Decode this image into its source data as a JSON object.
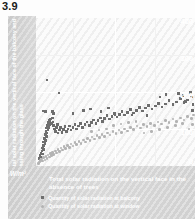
{
  "figure": {
    "number": "3.9"
  },
  "chart_data": {
    "type": "scatter",
    "title": "",
    "xlabel": "Total solar radiation on the vertical face in the absence of trees",
    "ylabel": "Total solar radiation on the vertical face of the balcony and passing through the glass",
    "unit": "W/m²",
    "yticks": [
      "400",
      "300",
      "200",
      "100",
      "0"
    ],
    "ylim": [
      0,
      430
    ],
    "xlim": [
      0,
      430
    ],
    "grid": true,
    "legend_position": "bottom-left",
    "series": [
      {
        "name": "Quantity of solar radiation at balcony",
        "marker": "square",
        "color": "#6e6e6e",
        "points": [
          [
            8,
            22
          ],
          [
            11,
            30
          ],
          [
            13,
            38
          ],
          [
            14,
            26
          ],
          [
            16,
            44
          ],
          [
            17,
            52
          ],
          [
            18,
            35
          ],
          [
            19,
            60
          ],
          [
            20,
            48
          ],
          [
            21,
            70
          ],
          [
            22,
            58
          ],
          [
            23,
            80
          ],
          [
            24,
            66
          ],
          [
            25,
            92
          ],
          [
            26,
            74
          ],
          [
            27,
            100
          ],
          [
            28,
            86
          ],
          [
            29,
            110
          ],
          [
            30,
            96
          ],
          [
            31,
            118
          ],
          [
            33,
            104
          ],
          [
            34,
            126
          ],
          [
            35,
            112
          ],
          [
            36,
            132
          ],
          [
            38,
            120
          ],
          [
            40,
            136
          ],
          [
            42,
            124
          ],
          [
            44,
            140
          ],
          [
            46,
            128
          ],
          [
            48,
            118
          ],
          [
            50,
            108
          ],
          [
            52,
            100
          ],
          [
            55,
            112
          ],
          [
            58,
            120
          ],
          [
            60,
            96
          ],
          [
            63,
            104
          ],
          [
            66,
            112
          ],
          [
            70,
            98
          ],
          [
            74,
            106
          ],
          [
            78,
            114
          ],
          [
            82,
            100
          ],
          [
            86,
            108
          ],
          [
            90,
            116
          ],
          [
            95,
            104
          ],
          [
            100,
            112
          ],
          [
            105,
            120
          ],
          [
            110,
            108
          ],
          [
            115,
            116
          ],
          [
            120,
            124
          ],
          [
            126,
            112
          ],
          [
            132,
            120
          ],
          [
            138,
            128
          ],
          [
            144,
            118
          ],
          [
            150,
            126
          ],
          [
            156,
            134
          ],
          [
            162,
            124
          ],
          [
            168,
            132
          ],
          [
            174,
            140
          ],
          [
            180,
            130
          ],
          [
            186,
            138
          ],
          [
            192,
            146
          ],
          [
            198,
            136
          ],
          [
            205,
            144
          ],
          [
            212,
            152
          ],
          [
            219,
            142
          ],
          [
            226,
            150
          ],
          [
            233,
            158
          ],
          [
            240,
            148
          ],
          [
            248,
            156
          ],
          [
            256,
            164
          ],
          [
            264,
            154
          ],
          [
            272,
            162
          ],
          [
            280,
            170
          ],
          [
            288,
            160
          ],
          [
            296,
            168
          ],
          [
            305,
            176
          ],
          [
            314,
            166
          ],
          [
            323,
            174
          ],
          [
            332,
            182
          ],
          [
            341,
            172
          ],
          [
            350,
            180
          ],
          [
            360,
            190
          ],
          [
            370,
            178
          ],
          [
            380,
            186
          ],
          [
            390,
            196
          ],
          [
            400,
            184
          ],
          [
            410,
            192
          ],
          [
            420,
            200
          ],
          [
            425,
            178
          ],
          [
            30,
            250
          ],
          [
            62,
            212
          ],
          [
            20,
            160
          ],
          [
            26,
            158
          ],
          [
            44,
            158
          ],
          [
            48,
            152
          ],
          [
            100,
            152
          ],
          [
            128,
            162
          ],
          [
            148,
            166
          ],
          [
            176,
            158
          ],
          [
            196,
            168
          ],
          [
            214,
            150
          ],
          [
            260,
            148
          ],
          [
            300,
            146
          ],
          [
            335,
            200
          ],
          [
            352,
            208
          ],
          [
            386,
            210
          ],
          [
            398,
            204
          ],
          [
            404,
            188
          ],
          [
            418,
            214
          ],
          [
            424,
            162
          ]
        ]
      },
      {
        "name": "Quantity of solar radiation at window",
        "marker": "circle",
        "color": "#b3b3b3",
        "points": [
          [
            6,
            8
          ],
          [
            9,
            12
          ],
          [
            12,
            16
          ],
          [
            15,
            20
          ],
          [
            18,
            14
          ],
          [
            21,
            24
          ],
          [
            24,
            18
          ],
          [
            27,
            28
          ],
          [
            30,
            22
          ],
          [
            33,
            32
          ],
          [
            36,
            26
          ],
          [
            39,
            36
          ],
          [
            42,
            30
          ],
          [
            45,
            40
          ],
          [
            48,
            34
          ],
          [
            52,
            44
          ],
          [
            56,
            38
          ],
          [
            60,
            48
          ],
          [
            64,
            42
          ],
          [
            68,
            52
          ],
          [
            72,
            46
          ],
          [
            76,
            56
          ],
          [
            80,
            50
          ],
          [
            85,
            60
          ],
          [
            90,
            54
          ],
          [
            95,
            64
          ],
          [
            100,
            58
          ],
          [
            105,
            68
          ],
          [
            110,
            62
          ],
          [
            116,
            72
          ],
          [
            122,
            66
          ],
          [
            128,
            76
          ],
          [
            134,
            70
          ],
          [
            140,
            80
          ],
          [
            146,
            74
          ],
          [
            152,
            84
          ],
          [
            158,
            78
          ],
          [
            165,
            88
          ],
          [
            172,
            82
          ],
          [
            179,
            92
          ],
          [
            186,
            86
          ],
          [
            193,
            96
          ],
          [
            200,
            90
          ],
          [
            208,
            100
          ],
          [
            216,
            94
          ],
          [
            224,
            104
          ],
          [
            232,
            98
          ],
          [
            240,
            108
          ],
          [
            248,
            102
          ],
          [
            256,
            112
          ],
          [
            264,
            106
          ],
          [
            273,
            116
          ],
          [
            282,
            110
          ],
          [
            291,
            120
          ],
          [
            300,
            114
          ],
          [
            310,
            124
          ],
          [
            320,
            118
          ],
          [
            330,
            128
          ],
          [
            340,
            122
          ],
          [
            350,
            132
          ],
          [
            360,
            126
          ],
          [
            370,
            136
          ],
          [
            380,
            130
          ],
          [
            390,
            140
          ],
          [
            400,
            134
          ],
          [
            410,
            144
          ],
          [
            420,
            138
          ],
          [
            426,
            148
          ],
          [
            150,
            100
          ],
          [
            170,
            104
          ],
          [
            190,
            108
          ],
          [
            210,
            118
          ],
          [
            230,
            122
          ],
          [
            250,
            126
          ],
          [
            270,
            130
          ],
          [
            292,
            96
          ],
          [
            312,
            100
          ],
          [
            334,
            106
          ],
          [
            356,
            112
          ],
          [
            378,
            118
          ],
          [
            396,
            124
          ],
          [
            414,
            108
          ],
          [
            424,
            120
          ]
        ]
      }
    ]
  },
  "legend": [
    {
      "label": "Quantity of solar radiation at balcony",
      "marker": "square"
    },
    {
      "label": "Quantity of solar radiation at window",
      "marker": "circle"
    }
  ]
}
